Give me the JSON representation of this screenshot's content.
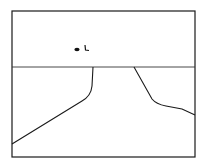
{
  "drawing": {
    "description": "Line sketch of a road receding to the horizon, with two small marks in the sky",
    "background": "#ffffff",
    "stroke_color": "#1a1a1a",
    "frame": {
      "x": 12,
      "y": 11,
      "width": 183,
      "height": 146
    },
    "horizon": {
      "x1": 12,
      "y1": 67,
      "x2": 195,
      "y2": 67
    },
    "road_left_edge": "M93,67 L92,86 Q91,96 82,101 L12,144",
    "road_right_edge": "M134,67 L152,99 Q156,104 166,106 L182,109 L195,115",
    "sky_marks": [
      {
        "type": "blob",
        "cx": 77,
        "cy": 49.5,
        "rx": 2.6,
        "ry": 1.8
      },
      {
        "type": "hook",
        "path": "M85,45 L85.5,50 L89,50.5"
      }
    ]
  }
}
